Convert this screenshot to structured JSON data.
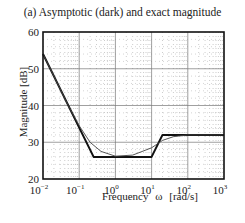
{
  "chart_data": {
    "type": "line",
    "title": "(a) Asymptotic (dark) and exact magnitude",
    "xlabel": "Frequency   ω   [rad/s]",
    "ylabel": "Magnitude [dB]",
    "xscale": "log",
    "xlim": [
      0.01,
      1000
    ],
    "ylim": [
      20,
      60
    ],
    "x_ticks": [
      "10^-2",
      "10^-1",
      "10^0",
      "10^1",
      "10^2",
      "10^3"
    ],
    "y_ticks": [
      20,
      30,
      40,
      50,
      60
    ],
    "grid": true,
    "series": [
      {
        "name": "Asymptotic",
        "style": "dark",
        "x": [
          0.01,
          0.25,
          10,
          20,
          1000
        ],
        "y": [
          54,
          26,
          26,
          32,
          32
        ]
      },
      {
        "name": "Exact",
        "style": "thin",
        "x": [
          0.01,
          0.05,
          0.1,
          0.2,
          0.4,
          1,
          3,
          10,
          20,
          40,
          100,
          1000
        ],
        "y": [
          54,
          40,
          34.5,
          30,
          27.5,
          26.2,
          26.5,
          28.5,
          30.5,
          31.5,
          32,
          32
        ]
      }
    ]
  },
  "labels": {
    "title": "(a) Asymptotic (dark) and exact magnitude",
    "ylabel": "Magnitude [dB]",
    "xlabel": "Frequency   ω   [rad/s]"
  }
}
